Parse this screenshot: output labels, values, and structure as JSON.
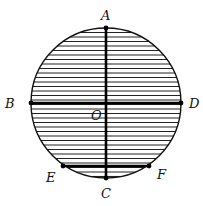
{
  "diagram": {
    "circle": {
      "cx": 106,
      "cy": 103,
      "r": 75,
      "hatch_spacing": 4.5
    },
    "points": [
      {
        "id": "A",
        "label": "A",
        "x": 106,
        "y": 28,
        "lx": 101,
        "ly": 9
      },
      {
        "id": "B",
        "label": "B",
        "x": 31,
        "y": 103,
        "lx": 5,
        "ly": 97
      },
      {
        "id": "C",
        "label": "C",
        "x": 106,
        "y": 178,
        "lx": 101,
        "ly": 187
      },
      {
        "id": "D",
        "label": "D",
        "x": 181,
        "y": 103,
        "lx": 189,
        "ly": 97
      },
      {
        "id": "E",
        "label": "E",
        "x": 63,
        "y": 166,
        "lx": 46,
        "ly": 171
      },
      {
        "id": "F",
        "label": "F",
        "x": 149,
        "y": 166,
        "lx": 157,
        "ly": 168
      },
      {
        "id": "O",
        "label": "O",
        "x": 106,
        "y": 103,
        "lx": 91,
        "ly": 109
      }
    ],
    "segments": [
      {
        "from": "A",
        "to": "C"
      },
      {
        "from": "B",
        "to": "D"
      },
      {
        "from": "E",
        "to": "F"
      }
    ]
  }
}
